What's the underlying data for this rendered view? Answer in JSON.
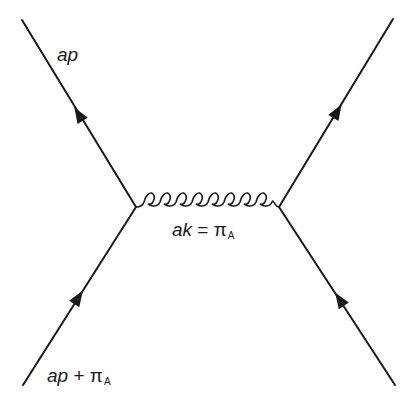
{
  "diagram": {
    "type": "feynman-diagram",
    "colors": {
      "line": "#1a1a1a",
      "background": "#ffffff"
    },
    "vertices": [
      {
        "id": "left-vertex",
        "x": 136,
        "y": 207
      },
      {
        "id": "right-vertex",
        "x": 279,
        "y": 207
      }
    ],
    "fermion_lines": [
      {
        "id": "top-left",
        "from": [
          136,
          207
        ],
        "to": [
          22,
          20
        ],
        "arrow_direction": "outgoing"
      },
      {
        "id": "bottom-left",
        "from": [
          23,
          385
        ],
        "to": [
          136,
          207
        ],
        "arrow_direction": "incoming"
      },
      {
        "id": "top-right",
        "from": [
          279,
          207
        ],
        "to": [
          393,
          19
        ],
        "arrow_direction": "outgoing"
      },
      {
        "id": "bottom-right",
        "from": [
          395,
          385
        ],
        "to": [
          279,
          207
        ],
        "arrow_direction": "incoming"
      }
    ],
    "gluon": {
      "from": [
        136,
        207
      ],
      "to": [
        279,
        207
      ],
      "loops": 9
    },
    "labels": {
      "outgoing_momentum": {
        "main": "ap",
        "sub": ""
      },
      "incoming_momentum": {
        "main": "ap",
        "op": " + π",
        "sub": "A"
      },
      "gluon_momentum": {
        "main": "ak",
        "op": " = π",
        "sub": "A"
      }
    }
  }
}
